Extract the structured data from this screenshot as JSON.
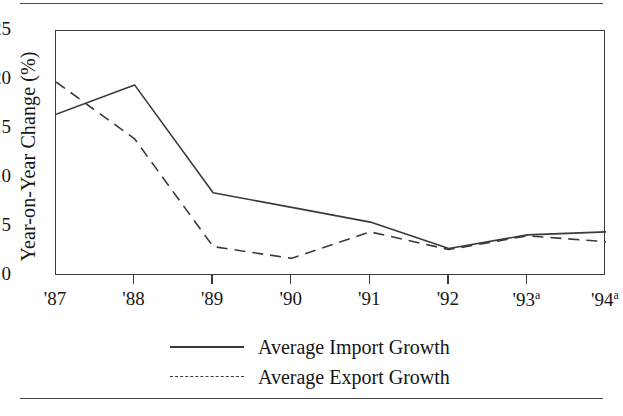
{
  "chart_data": {
    "type": "line",
    "title": "",
    "xlabel": "",
    "ylabel": "Year-on-Year Change (%)",
    "categories": [
      "'87",
      "'88",
      "'89",
      "'90",
      "'91",
      "'92",
      "'93a",
      "'94a"
    ],
    "xticklabels": [
      "'87",
      "'88",
      "'89",
      "'90",
      "'91",
      "'92",
      "'93",
      "'94"
    ],
    "xtick_superscripts": [
      "",
      "",
      "",
      "",
      "",
      "",
      "a",
      "a"
    ],
    "yticklabels": [
      "25",
      "20",
      "15",
      "10",
      "5",
      "0"
    ],
    "ytickvalues": [
      25,
      20,
      15,
      10,
      5,
      0
    ],
    "ylim": [
      0,
      25
    ],
    "grid": false,
    "legend_position": "below-center",
    "series": [
      {
        "name": "Average Import Growth",
        "style": "solid",
        "color": "#3a3a3a",
        "values": [
          16.5,
          19.5,
          8.5,
          7.0,
          5.5,
          2.8,
          4.2,
          4.5
        ]
      },
      {
        "name": "Average Export Growth",
        "style": "dashed",
        "color": "#3a3a3a",
        "values": [
          19.8,
          14.0,
          3.0,
          1.8,
          4.5,
          2.7,
          4.1,
          3.5
        ]
      }
    ]
  },
  "legend": {
    "items": [
      {
        "label": "Average Import Growth",
        "style": "solid"
      },
      {
        "label": "Average Export Growth",
        "style": "dashed"
      }
    ]
  },
  "axis": {
    "y_title": "Year-on-Year Change (%)"
  }
}
